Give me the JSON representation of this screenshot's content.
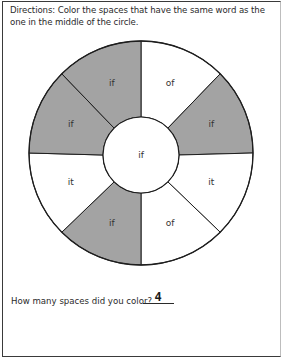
{
  "worksheet": {
    "directions": "Directions: Color the spaces that have the same word as the one in the middle of the circle.",
    "center_word": "if",
    "segments": [
      {
        "position": "top-right",
        "word": "of",
        "colored": false
      },
      {
        "position": "right-upper",
        "word": "if",
        "colored": true
      },
      {
        "position": "right-lower",
        "word": "it",
        "colored": false
      },
      {
        "position": "bottom-right",
        "word": "of",
        "colored": false
      },
      {
        "position": "bottom-left",
        "word": "if",
        "colored": true
      },
      {
        "position": "left-lower",
        "word": "it",
        "colored": false
      },
      {
        "position": "left-upper",
        "word": "if",
        "colored": true
      },
      {
        "position": "top-left",
        "word": "if",
        "colored": true
      }
    ],
    "question": "How many spaces did you color?",
    "answer": "4"
  },
  "colors": {
    "colored_fill": "#a3a3a3",
    "uncolored_fill": "#ffffff",
    "stroke": "#1e1e1e"
  }
}
